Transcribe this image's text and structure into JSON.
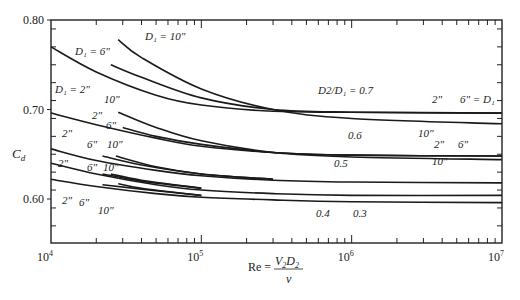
{
  "chart_data": {
    "type": "line",
    "title": "",
    "xlabel": "Re = V2 D2 / ν",
    "ylabel": "Cd",
    "xscale": "log",
    "xlim": [
      10000,
      10000000
    ],
    "ylim": [
      0.56,
      0.8
    ],
    "x_ticks": [
      "10^4",
      "10^5",
      "10^6",
      "10^7"
    ],
    "y_ticks": [
      "0.60",
      "0.70",
      "0.80"
    ],
    "grid": false,
    "series": [
      {
        "name": "D2/D1=0.7, D1=2\"",
        "x": [
          10000,
          20000,
          50000,
          100000,
          300000,
          1000000,
          10000000
        ],
        "values": [
          0.77,
          0.742,
          0.716,
          0.705,
          0.698,
          0.697,
          0.696
        ]
      },
      {
        "name": "D2/D1=0.7, D1=6\"",
        "x": [
          25000,
          40000,
          100000,
          300000,
          1000000,
          10000000
        ],
        "values": [
          0.75,
          0.736,
          0.713,
          0.7,
          0.697,
          0.696
        ]
      },
      {
        "name": "D2/D1=0.7, D1=10\"",
        "x": [
          28000,
          40000,
          100000,
          300000,
          1000000,
          10000000
        ],
        "values": [
          0.778,
          0.758,
          0.723,
          0.7,
          0.69,
          0.684
        ]
      },
      {
        "name": "D2/D1=0.6, D1=2\"",
        "x": [
          10000,
          20000,
          50000,
          100000,
          300000,
          1000000,
          10000000
        ],
        "values": [
          0.696,
          0.683,
          0.668,
          0.659,
          0.652,
          0.649,
          0.648
        ]
      },
      {
        "name": "D2/D1=0.6, D1=6\"",
        "x": [
          30000,
          50000,
          100000,
          300000,
          1000000,
          10000000
        ],
        "values": [
          0.68,
          0.67,
          0.661,
          0.652,
          0.649,
          0.648
        ]
      },
      {
        "name": "D2/D1=0.6, D1=10\"",
        "x": [
          28000,
          50000,
          100000,
          300000,
          1000000,
          10000000
        ],
        "values": [
          0.697,
          0.68,
          0.665,
          0.652,
          0.647,
          0.644
        ]
      },
      {
        "name": "D2/D1=0.5, D1=2\"",
        "x": [
          10000,
          20000,
          50000,
          100000,
          300000,
          1000000,
          10000000
        ],
        "values": [
          0.656,
          0.643,
          0.632,
          0.626,
          0.621,
          0.619,
          0.618
        ]
      },
      {
        "name": "D2/D1=0.5, D1=6\"",
        "x": [
          22000,
          40000,
          100000,
          300000
        ],
        "values": [
          0.648,
          0.638,
          0.628,
          0.622
        ]
      },
      {
        "name": "D2/D1=0.5, D1=10\"",
        "x": [
          27000,
          50000,
          100000,
          300000
        ],
        "values": [
          0.648,
          0.636,
          0.628,
          0.622
        ]
      },
      {
        "name": "D2/D1=0.4, D1=2\"",
        "x": [
          10000,
          20000,
          50000,
          100000,
          300000,
          1000000,
          10000000
        ],
        "values": [
          0.64,
          0.628,
          0.616,
          0.61,
          0.606,
          0.604,
          0.604
        ]
      },
      {
        "name": "D2/D1=0.4, D1=6\"",
        "x": [
          22000,
          40000,
          100000
        ],
        "values": [
          0.628,
          0.62,
          0.612
        ]
      },
      {
        "name": "D2/D1=0.4, D1=10\"",
        "x": [
          25000,
          40000,
          100000
        ],
        "values": [
          0.628,
          0.621,
          0.612
        ]
      },
      {
        "name": "D2/D1=0.3, D1=2\"",
        "x": [
          10000,
          20000,
          50000,
          100000,
          300000,
          1000000,
          10000000
        ],
        "values": [
          0.622,
          0.614,
          0.606,
          0.602,
          0.599,
          0.597,
          0.596
        ]
      },
      {
        "name": "D2/D1=0.3, D1=6\"",
        "x": [
          22000,
          40000,
          100000
        ],
        "values": [
          0.616,
          0.611,
          0.604
        ]
      },
      {
        "name": "D2/D1=0.3, D1=10\"",
        "x": [
          28000,
          40000,
          100000
        ],
        "values": [
          0.617,
          0.612,
          0.604
        ]
      }
    ],
    "annotations": [
      {
        "text": "D1 = 10\"",
        "x": 145,
        "y": 40
      },
      {
        "text": "D1 = 6\"",
        "x": 75,
        "y": 55
      },
      {
        "text": "D1 = 2\"",
        "x": 55,
        "y": 93
      },
      {
        "text": "D2/D1 = 0.7",
        "x": 318,
        "y": 94
      },
      {
        "text": "2\"",
        "x": 432,
        "y": 103
      },
      {
        "text": "6\" = D1",
        "x": 460,
        "y": 103
      },
      {
        "text": "10\"",
        "x": 418,
        "y": 137
      },
      {
        "text": "10\"",
        "x": 104,
        "y": 103
      },
      {
        "text": "2\"",
        "x": 92,
        "y": 119
      },
      {
        "text": "6\"",
        "x": 106,
        "y": 129
      },
      {
        "text": "0.6",
        "x": 348,
        "y": 139
      },
      {
        "text": "2\"",
        "x": 434,
        "y": 148
      },
      {
        "text": "6\"",
        "x": 458,
        "y": 148
      },
      {
        "text": "10\"",
        "x": 432,
        "y": 165
      },
      {
        "text": "0.5",
        "x": 334,
        "y": 167
      },
      {
        "text": "0.4",
        "x": 316,
        "y": 217
      },
      {
        "text": "0.3",
        "x": 353,
        "y": 217
      },
      {
        "text": "2\"",
        "x": 62,
        "y": 137
      },
      {
        "text": "6\"",
        "x": 87,
        "y": 148
      },
      {
        "text": "10\"",
        "x": 107,
        "y": 148
      },
      {
        "text": "2\"",
        "x": 58,
        "y": 167
      },
      {
        "text": "6\"",
        "x": 87,
        "y": 171
      },
      {
        "text": "10\"",
        "x": 103,
        "y": 171
      },
      {
        "text": "2\"",
        "x": 62,
        "y": 204
      },
      {
        "text": "6\"",
        "x": 79,
        "y": 206
      },
      {
        "text": "10\"",
        "x": 98,
        "y": 214
      }
    ]
  },
  "axes": {
    "y_labels": [
      {
        "text": "0.80",
        "v": 0.8
      },
      {
        "text": "0.70",
        "v": 0.7
      },
      {
        "text": "0.60",
        "v": 0.6
      }
    ],
    "x_labels": [
      {
        "base": "10",
        "exp": "4",
        "e": 4
      },
      {
        "base": "10",
        "exp": "5",
        "e": 5
      },
      {
        "base": "10",
        "exp": "6",
        "e": 6
      },
      {
        "base": "10",
        "exp": "7",
        "e": 7
      }
    ],
    "ylabel_main": "C",
    "ylabel_sub": "d",
    "xlabel_prefix": "Re =",
    "xlabel_num": "V",
    "xlabel_num_sub1": "2",
    "xlabel_num_mid": "D",
    "xlabel_num_sub2": "2",
    "xlabel_den": "ν"
  }
}
